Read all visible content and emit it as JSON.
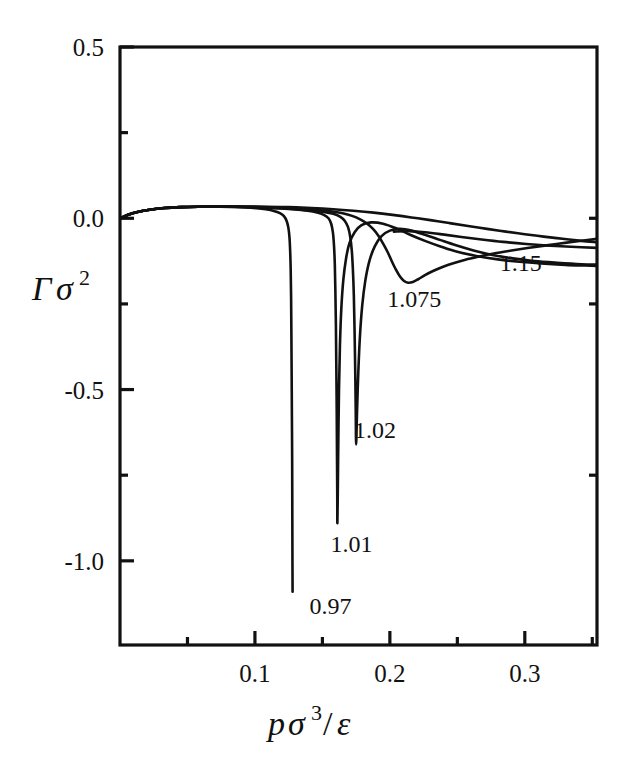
{
  "chart_data": {
    "type": "line",
    "title": "",
    "subtitle": "",
    "xlabel": "pσ³/ε",
    "ylabel": "Γσ²",
    "xlabel_parts": {
      "base1": "p",
      "base2": "σ",
      "sup": "3",
      "slash": "/",
      "base3": "ε"
    },
    "ylabel_parts": {
      "base1": "Γ",
      "base2": "σ",
      "sup": "2"
    },
    "xlim": [
      0.0,
      0.3535
    ],
    "ylim": [
      -1.2457,
      0.5
    ],
    "grid": false,
    "legend": "inline-curve-labels",
    "legend_position": "inline",
    "x_major_ticks": [
      0.1,
      0.2,
      0.3
    ],
    "x_major_tick_labels": [
      "0.1",
      "0.2",
      "0.3"
    ],
    "x_minor_ticks": [
      0.05,
      0.15,
      0.25,
      0.35
    ],
    "y_major_ticks": [
      0.5,
      0.0,
      -0.5,
      -1.0
    ],
    "y_major_tick_labels": [
      "0.5",
      "0.0",
      "-0.5",
      "-1.0"
    ],
    "y_minor_ticks": [
      0.25,
      -0.25,
      -0.75
    ],
    "series": [
      {
        "name": "0.97",
        "label": "0.97",
        "label_x": 0.1405,
        "label_y": -1.155,
        "points": [
          [
            0.0,
            0.0
          ],
          [
            0.006,
            0.0105
          ],
          [
            0.013,
            0.0185
          ],
          [
            0.022,
            0.025
          ],
          [
            0.033,
            0.0298
          ],
          [
            0.045,
            0.0325
          ],
          [
            0.058,
            0.0338
          ],
          [
            0.07,
            0.034
          ],
          [
            0.082,
            0.0333
          ],
          [
            0.093,
            0.0318
          ],
          [
            0.101,
            0.0295
          ],
          [
            0.108,
            0.0262
          ],
          [
            0.114,
            0.0215
          ],
          [
            0.1185,
            0.015
          ],
          [
            0.1215,
            0.006
          ],
          [
            0.1235,
            -0.008
          ],
          [
            0.1248,
            -0.028
          ],
          [
            0.1256,
            -0.056
          ],
          [
            0.1261,
            -0.095
          ],
          [
            0.1265,
            -0.15
          ],
          [
            0.1268,
            -0.23
          ],
          [
            0.127,
            -0.33
          ],
          [
            0.1272,
            -0.45
          ],
          [
            0.1274,
            -0.58
          ],
          [
            0.1276,
            -0.72
          ],
          [
            0.1277,
            -0.86
          ],
          [
            0.1278,
            -1.0
          ],
          [
            0.1279,
            -1.09
          ]
        ]
      },
      {
        "name": "1.01",
        "label": "1.01",
        "label_x": 0.156,
        "label_y": -0.975,
        "points": [
          [
            0.0,
            0.0
          ],
          [
            0.006,
            0.0105
          ],
          [
            0.013,
            0.0185
          ],
          [
            0.022,
            0.025
          ],
          [
            0.033,
            0.0298
          ],
          [
            0.045,
            0.0325
          ],
          [
            0.058,
            0.0338
          ],
          [
            0.07,
            0.034
          ],
          [
            0.085,
            0.0335
          ],
          [
            0.1,
            0.032
          ],
          [
            0.115,
            0.0295
          ],
          [
            0.128,
            0.0262
          ],
          [
            0.139,
            0.0218
          ],
          [
            0.146,
            0.0168
          ],
          [
            0.151,
            0.01
          ],
          [
            0.1545,
            0.0
          ],
          [
            0.1565,
            -0.016
          ],
          [
            0.1578,
            -0.042
          ],
          [
            0.1586,
            -0.08
          ],
          [
            0.1592,
            -0.135
          ],
          [
            0.1596,
            -0.21
          ],
          [
            0.16,
            -0.31
          ],
          [
            0.1603,
            -0.43
          ],
          [
            0.1606,
            -0.56
          ],
          [
            0.1608,
            -0.69
          ],
          [
            0.161,
            -0.81
          ],
          [
            0.1611,
            -0.89
          ],
          [
            0.1614,
            -0.8
          ],
          [
            0.1618,
            -0.65
          ],
          [
            0.1623,
            -0.5
          ],
          [
            0.163,
            -0.37
          ],
          [
            0.164,
            -0.265
          ],
          [
            0.1655,
            -0.18
          ],
          [
            0.1675,
            -0.118
          ],
          [
            0.17,
            -0.073
          ],
          [
            0.174,
            -0.04
          ],
          [
            0.179,
            -0.02
          ],
          [
            0.186,
            -0.012
          ],
          [
            0.195,
            -0.016
          ],
          [
            0.205,
            -0.03
          ],
          [
            0.215,
            -0.048
          ],
          [
            0.226,
            -0.066
          ],
          [
            0.238,
            -0.083
          ],
          [
            0.25,
            -0.098
          ],
          [
            0.264,
            -0.11
          ],
          [
            0.28,
            -0.12
          ],
          [
            0.296,
            -0.127
          ],
          [
            0.312,
            -0.132
          ],
          [
            0.33,
            -0.136
          ],
          [
            0.345,
            -0.138
          ],
          [
            0.3535,
            -0.139
          ]
        ]
      },
      {
        "name": "1.02",
        "label": "1.02",
        "label_x": 0.1735,
        "label_y": -0.64,
        "points": [
          [
            0.0,
            0.0
          ],
          [
            0.006,
            0.0105
          ],
          [
            0.013,
            0.0185
          ],
          [
            0.022,
            0.025
          ],
          [
            0.033,
            0.0298
          ],
          [
            0.045,
            0.0325
          ],
          [
            0.058,
            0.0338
          ],
          [
            0.07,
            0.034
          ],
          [
            0.085,
            0.0336
          ],
          [
            0.1,
            0.0322
          ],
          [
            0.115,
            0.03
          ],
          [
            0.13,
            0.0268
          ],
          [
            0.142,
            0.023
          ],
          [
            0.151,
            0.0186
          ],
          [
            0.158,
            0.013
          ],
          [
            0.163,
            0.005
          ],
          [
            0.1665,
            -0.007
          ],
          [
            0.169,
            -0.026
          ],
          [
            0.1706,
            -0.054
          ],
          [
            0.1718,
            -0.095
          ],
          [
            0.1726,
            -0.15
          ],
          [
            0.1733,
            -0.225
          ],
          [
            0.1738,
            -0.32
          ],
          [
            0.1743,
            -0.44
          ],
          [
            0.1747,
            -0.56
          ],
          [
            0.175,
            -0.66
          ],
          [
            0.1757,
            -0.56
          ],
          [
            0.1766,
            -0.45
          ],
          [
            0.1778,
            -0.345
          ],
          [
            0.1795,
            -0.255
          ],
          [
            0.1818,
            -0.182
          ],
          [
            0.1848,
            -0.125
          ],
          [
            0.1888,
            -0.082
          ],
          [
            0.1938,
            -0.052
          ],
          [
            0.2,
            -0.036
          ],
          [
            0.2075,
            -0.031
          ],
          [
            0.216,
            -0.036
          ],
          [
            0.226,
            -0.048
          ],
          [
            0.237,
            -0.063
          ],
          [
            0.249,
            -0.079
          ],
          [
            0.262,
            -0.094
          ],
          [
            0.276,
            -0.107
          ],
          [
            0.291,
            -0.117
          ],
          [
            0.307,
            -0.125
          ],
          [
            0.324,
            -0.13
          ],
          [
            0.342,
            -0.134
          ],
          [
            0.3535,
            -0.135
          ]
        ]
      },
      {
        "name": "1.075",
        "label": "1.075",
        "label_x": 0.198,
        "label_y": -0.26,
        "points": [
          [
            0.0,
            0.0
          ],
          [
            0.006,
            0.0105
          ],
          [
            0.013,
            0.0185
          ],
          [
            0.022,
            0.025
          ],
          [
            0.033,
            0.0298
          ],
          [
            0.045,
            0.0325
          ],
          [
            0.058,
            0.0338
          ],
          [
            0.07,
            0.0342
          ],
          [
            0.087,
            0.034
          ],
          [
            0.104,
            0.033
          ],
          [
            0.12,
            0.0312
          ],
          [
            0.134,
            0.0285
          ],
          [
            0.146,
            0.025
          ],
          [
            0.156,
            0.0205
          ],
          [
            0.165,
            0.0145
          ],
          [
            0.172,
            0.007
          ],
          [
            0.178,
            -0.003
          ],
          [
            0.183,
            -0.015
          ],
          [
            0.1875,
            -0.031
          ],
          [
            0.1915,
            -0.051
          ],
          [
            0.195,
            -0.074
          ],
          [
            0.1985,
            -0.1
          ],
          [
            0.2015,
            -0.126
          ],
          [
            0.2045,
            -0.15
          ],
          [
            0.2075,
            -0.17
          ],
          [
            0.2105,
            -0.183
          ],
          [
            0.2135,
            -0.188
          ],
          [
            0.217,
            -0.186
          ],
          [
            0.221,
            -0.178
          ],
          [
            0.226,
            -0.166
          ],
          [
            0.232,
            -0.154
          ],
          [
            0.239,
            -0.142
          ],
          [
            0.247,
            -0.131
          ],
          [
            0.256,
            -0.121
          ],
          [
            0.266,
            -0.112
          ],
          [
            0.277,
            -0.103
          ],
          [
            0.289,
            -0.095
          ],
          [
            0.302,
            -0.087
          ],
          [
            0.316,
            -0.079
          ],
          [
            0.331,
            -0.071
          ],
          [
            0.345,
            -0.064
          ],
          [
            0.3535,
            -0.06
          ]
        ]
      },
      {
        "name": "1.15",
        "label": "1.15",
        "label_x": 0.2815,
        "label_y": -0.155,
        "points": [
          [
            0.0,
            0.0
          ],
          [
            0.006,
            0.0105
          ],
          [
            0.013,
            0.0185
          ],
          [
            0.022,
            0.025
          ],
          [
            0.033,
            0.0298
          ],
          [
            0.045,
            0.0325
          ],
          [
            0.058,
            0.0338
          ],
          [
            0.072,
            0.0344
          ],
          [
            0.09,
            0.0344
          ],
          [
            0.108,
            0.0338
          ],
          [
            0.125,
            0.0325
          ],
          [
            0.142,
            0.03
          ],
          [
            0.158,
            0.0265
          ],
          [
            0.173,
            0.022
          ],
          [
            0.188,
            0.0165
          ],
          [
            0.202,
            0.01
          ],
          [
            0.216,
            0.0025
          ],
          [
            0.23,
            -0.0055
          ],
          [
            0.244,
            -0.014
          ],
          [
            0.258,
            -0.0225
          ],
          [
            0.272,
            -0.031
          ],
          [
            0.286,
            -0.039
          ],
          [
            0.3,
            -0.0465
          ],
          [
            0.314,
            -0.0535
          ],
          [
            0.328,
            -0.06
          ],
          [
            0.342,
            -0.066
          ],
          [
            0.3535,
            -0.07
          ]
        ]
      },
      {
        "name": "upper-envelope",
        "label": "",
        "label_x": null,
        "label_y": null,
        "points": [
          [
            0.203,
            -0.039
          ],
          [
            0.214,
            -0.038
          ],
          [
            0.226,
            -0.041
          ],
          [
            0.239,
            -0.047
          ],
          [
            0.253,
            -0.0545
          ],
          [
            0.268,
            -0.062
          ],
          [
            0.284,
            -0.069
          ],
          [
            0.301,
            -0.075
          ],
          [
            0.319,
            -0.08
          ],
          [
            0.338,
            -0.084
          ],
          [
            0.3535,
            -0.0865
          ]
        ]
      }
    ]
  },
  "axes": {
    "frame_color": "#111111",
    "curve_color": "#111111",
    "background": "#ffffff"
  }
}
